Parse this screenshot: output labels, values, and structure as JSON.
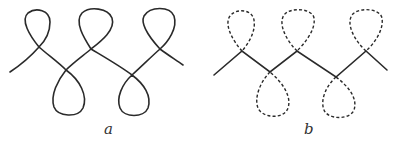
{
  "figure": {
    "panels": [
      {
        "id": "a",
        "label": "a",
        "line_style": "solid",
        "description": "Continuous looped curve with three upper loops and two lower loops"
      },
      {
        "id": "b",
        "label": "b",
        "line_style": "zigzag solid with dashed loops",
        "description": "Zigzag line with crossings; loops drawn dashed"
      }
    ],
    "stroke_color": "#2a2a2a"
  }
}
